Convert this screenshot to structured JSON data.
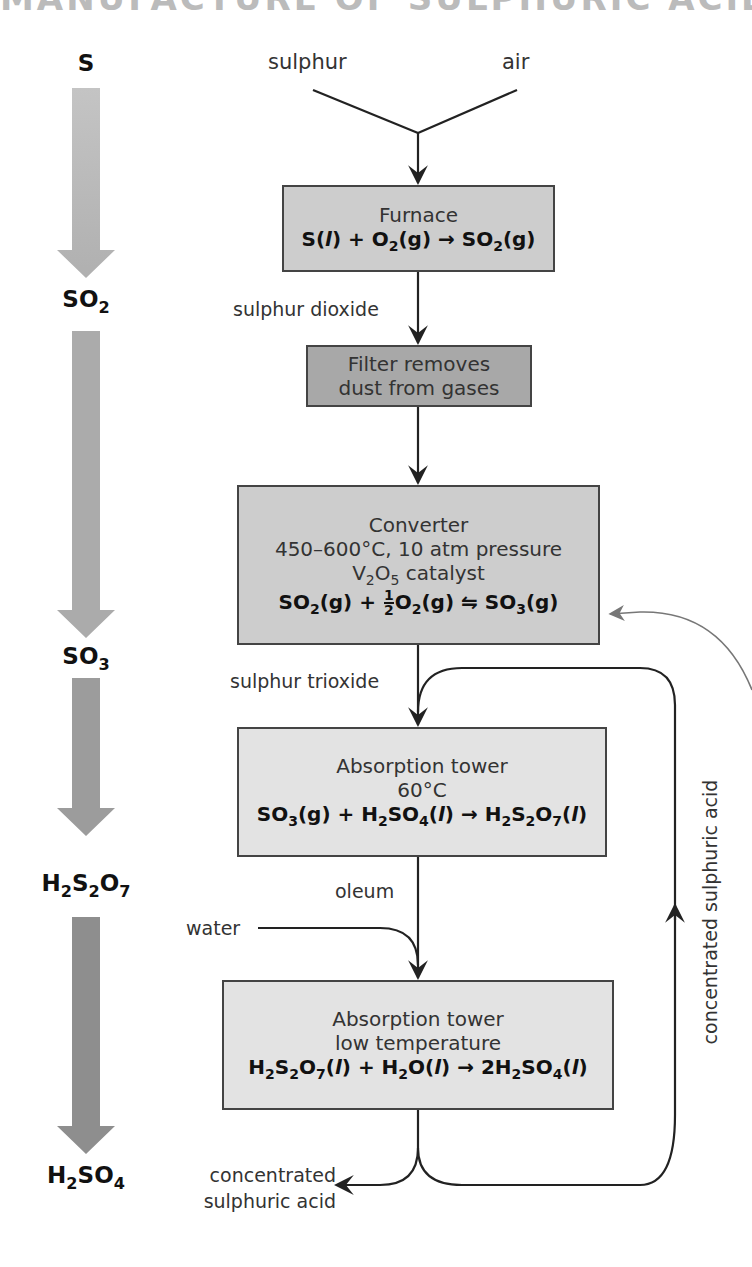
{
  "title": "MANUFACTURE OF SULPHURIC ACID",
  "inputs": {
    "sulphur": "sulphur",
    "air": "air",
    "water": "water"
  },
  "stream_labels": {
    "sulphur_dioxide": "sulphur dioxide",
    "sulphur_trioxide": "sulphur trioxide",
    "oleum": "oleum",
    "product_line1": "concentrated",
    "product_line2": "sulphuric acid",
    "recycle": "concentrated sulphuric acid"
  },
  "boxes": {
    "furnace": {
      "name": "Furnace",
      "equation": "S(l) + O2(g) → SO2(g)"
    },
    "filter": {
      "line1": "Filter removes",
      "line2": "dust from gases"
    },
    "converter": {
      "name": "Converter",
      "conditions": "450–600°C, 10 atm pressure",
      "catalyst": "V2O5 catalyst",
      "equation": "SO2(g) + 1/2 O2(g) ⇌ SO3(g)"
    },
    "absorption1": {
      "name": "Absorption tower",
      "conditions": "60°C",
      "equation": "SO3(g) + H2SO4(l) → H2S2O7(l)"
    },
    "absorption2": {
      "name": "Absorption tower",
      "conditions": "low temperature",
      "equation": "H2S2O7(l) + H2O(l) → 2H2SO4(l)"
    }
  },
  "species_column": [
    "S",
    "SO2",
    "SO3",
    "H2S2O7",
    "H2SO4"
  ],
  "colors": {
    "arrow1": "#b8b8b8",
    "arrow2": "#a9a9a9",
    "arrow3": "#9a9a9a",
    "arrow4": "#8c8c8c",
    "line": "#222222",
    "box_light": "#e3e3e3",
    "box_dark": "#a8a8a8"
  }
}
